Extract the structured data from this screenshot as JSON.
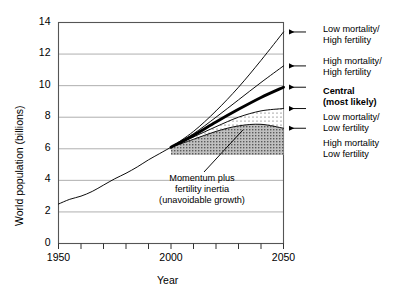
{
  "chart_data": {
    "type": "line",
    "title": "",
    "xlabel": "Year",
    "ylabel": "World population (billions)",
    "xlim": [
      1950,
      2050
    ],
    "ylim": [
      0,
      14
    ],
    "ytick_values": [
      0,
      2,
      4,
      6,
      8,
      10,
      12,
      14
    ],
    "ytick_labels": [
      "0",
      "2",
      "4",
      "6",
      "8",
      "10",
      "12",
      "14"
    ],
    "xtick_values": [
      1950,
      2000,
      2050
    ],
    "xtick_labels": [
      "1950",
      "2000",
      "2050"
    ],
    "x_minor_tick_interval": 10,
    "grid": "horizontal",
    "legend_position": "right-outside",
    "x_historical": [
      1950,
      1960,
      1970,
      1980,
      1990,
      2000
    ],
    "series": [
      {
        "name": "Historical",
        "style": "thin",
        "x": [
          1950,
          1955,
          1960,
          1965,
          1970,
          1975,
          1980,
          1985,
          1990,
          1995,
          2000
        ],
        "values": [
          2.5,
          2.8,
          3.0,
          3.3,
          3.7,
          4.1,
          4.45,
          4.85,
          5.3,
          5.7,
          6.1
        ]
      },
      {
        "name": "Low mortality/High fertility",
        "style": "thin",
        "x": [
          2000,
          2010,
          2020,
          2030,
          2040,
          2050
        ],
        "values": [
          6.1,
          7.1,
          8.4,
          9.9,
          11.6,
          13.4
        ]
      },
      {
        "name": "High mortality/High fertility",
        "style": "thin",
        "x": [
          2000,
          2010,
          2020,
          2030,
          2040,
          2050
        ],
        "values": [
          6.1,
          6.95,
          8.0,
          9.1,
          10.2,
          11.25
        ]
      },
      {
        "name": "Central (most likely)",
        "style": "thick",
        "x": [
          2000,
          2010,
          2020,
          2030,
          2040,
          2050
        ],
        "values": [
          6.1,
          6.85,
          7.7,
          8.5,
          9.25,
          9.9
        ]
      },
      {
        "name": "Low mortality/Low fertility",
        "style": "thin",
        "x": [
          2000,
          2010,
          2020,
          2030,
          2040,
          2050
        ],
        "values": [
          6.1,
          6.75,
          7.4,
          8.0,
          8.4,
          8.55
        ]
      },
      {
        "name": "High mortality/Low fertility",
        "style": "thin",
        "x": [
          2000,
          2010,
          2020,
          2030,
          2040,
          2050
        ],
        "values": [
          6.1,
          6.6,
          7.1,
          7.45,
          7.55,
          7.3
        ]
      }
    ],
    "shaded_regions": [
      {
        "name": "momentum-solid-fill",
        "fill": "dense-stipple",
        "upper_series": "High mortality/Low fertility",
        "lower_value": 5.6
      },
      {
        "name": "fertility-inertia-fill",
        "fill": "sparse-dots",
        "upper_series": "Low mortality/Low fertility",
        "lower_series": "High mortality/Low fertility"
      }
    ],
    "annotations": [
      {
        "name": "momentum-annotation",
        "lines": [
          "Momentum plus",
          "fertility inertia",
          "(unavoidable growth)"
        ],
        "points_to_x": 2032,
        "points_to_y": 7.2
      }
    ],
    "legend_entries": [
      {
        "id": "low-mort-high-fert",
        "lines": [
          "Low mortality/",
          "High fertility"
        ],
        "bold": false,
        "value_at_2050": 13.4
      },
      {
        "id": "high-mort-high-fert",
        "lines": [
          "High mortality/",
          "High fertility"
        ],
        "bold": false,
        "value_at_2050": 11.25
      },
      {
        "id": "central",
        "lines": [
          "Central",
          "(most likely)"
        ],
        "bold": true,
        "value_at_2050": 9.9
      },
      {
        "id": "low-mort-low-fert",
        "lines": [
          "Low mortality/",
          "Low fertility"
        ],
        "bold": false,
        "value_at_2050": 8.55
      },
      {
        "id": "high-mort-low-fert",
        "lines": [
          "High mortality",
          "Low fertility"
        ],
        "bold": false,
        "value_at_2050": 7.3
      }
    ],
    "colors": {
      "line": "#000000",
      "grid": "#9a9a9a",
      "frame": "#555555",
      "background": "#ffffff",
      "dense_fill": "#b4b4b4",
      "sparse_fill": "#f0f0f0"
    }
  }
}
